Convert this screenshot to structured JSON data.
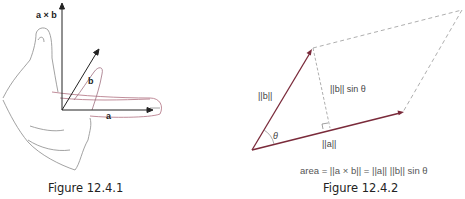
{
  "figure_1": {
    "caption": "Figure 12.4.1",
    "labels": {
      "cross_product": "a × b",
      "vector_a": "a",
      "vector_b": "b"
    }
  },
  "figure_2": {
    "caption": "Figure 12.4.2",
    "labels": {
      "norm_b": "||b||",
      "norm_a": "||a||",
      "height": "||b|| sin θ",
      "angle": "θ"
    },
    "formula": "area = ||a × b|| = ||a|| ||b|| sin θ"
  },
  "colors": {
    "vector": "#7a2a3a",
    "dashed": "#999999",
    "axis": "#222222",
    "hand_outline": "#8a8a8a",
    "finger_line": "#b06070"
  }
}
